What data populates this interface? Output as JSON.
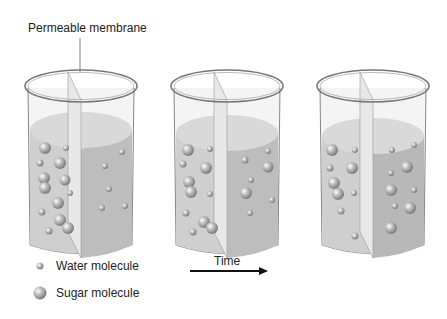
{
  "diagram": {
    "membrane_label": "Permeable membrane",
    "time_label": "Time",
    "legend": [
      {
        "label": "Water molecule",
        "icon": "small-sphere"
      },
      {
        "label": "Sugar molecule",
        "icon": "large-sphere"
      }
    ],
    "beakers": [
      {
        "stage": "initial",
        "left_level": "equal",
        "note": "more sugar on left side"
      },
      {
        "stage": "intermediate"
      },
      {
        "stage": "equilibrium"
      }
    ],
    "colors": {
      "liquid": "#c9c9c9",
      "liquid_dark": "#b5b5b5",
      "glass": "#8a8a8a",
      "text": "#222222"
    }
  }
}
